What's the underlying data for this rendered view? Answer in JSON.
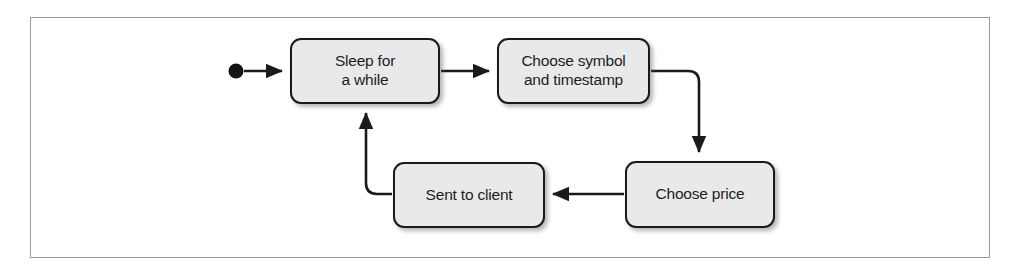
{
  "diagram": {
    "type": "flowchart",
    "title": "",
    "start_node": {
      "name": "start-dot",
      "shape": "filled-circle"
    },
    "nodes": [
      {
        "id": "sleep",
        "label": "Sleep for\na while"
      },
      {
        "id": "symbol",
        "label": "Choose symbol\nand timestamp"
      },
      {
        "id": "price",
        "label": "Choose price"
      },
      {
        "id": "sent",
        "label": "Sent to client"
      }
    ],
    "edges": [
      {
        "from": "start",
        "to": "sleep",
        "label": ""
      },
      {
        "from": "sleep",
        "to": "symbol",
        "label": ""
      },
      {
        "from": "symbol",
        "to": "price",
        "label": ""
      },
      {
        "from": "price",
        "to": "sent",
        "label": ""
      },
      {
        "from": "sent",
        "to": "sleep",
        "label": ""
      }
    ],
    "colors": {
      "node_fill": "#e9e9e9",
      "node_stroke": "#1a1a1a",
      "edge_stroke": "#1a1a1a",
      "frame_border": "#9a9a9a",
      "text": "#1d1d1d",
      "background": "#ffffff"
    }
  }
}
